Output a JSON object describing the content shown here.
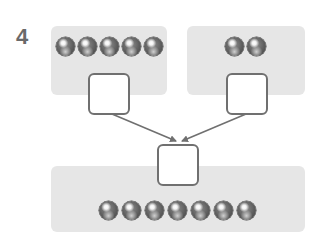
{
  "problem": {
    "number": "4"
  },
  "panels": {
    "left": {
      "ball_count": 5,
      "answer": ""
    },
    "right": {
      "ball_count": 2,
      "answer": ""
    },
    "bottom": {
      "ball_count": 7,
      "answer": ""
    }
  },
  "colors": {
    "panel_bg": "#e6e6e6",
    "box_border": "#707070",
    "arrow": "#707070",
    "number": "#6a6a6a"
  },
  "icons": {
    "ball": "gray-marble-icon",
    "arrow": "arrow-icon"
  }
}
